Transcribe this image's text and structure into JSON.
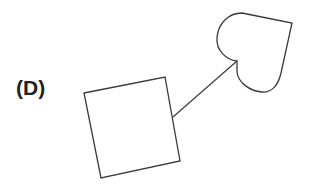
{
  "figure": {
    "label": "(D)",
    "stroke_color": "#3a3a3a",
    "shapes": [
      {
        "type": "square",
        "rotation_deg": -15,
        "corners": [
          [
            84,
            93
          ],
          [
            165,
            77
          ],
          [
            180,
            161
          ],
          [
            101,
            178
          ]
        ]
      },
      {
        "type": "heart",
        "rotation_deg": 30
      },
      {
        "type": "line",
        "from": [
          173,
          117
        ],
        "to": [
          237,
          61
        ],
        "connects": [
          "square",
          "heart"
        ]
      }
    ]
  }
}
